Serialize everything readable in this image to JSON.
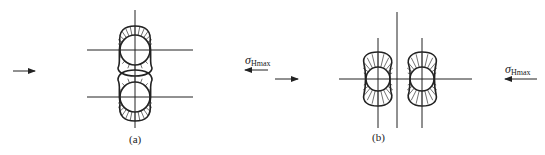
{
  "figure": {
    "panels": [
      {
        "id": "a",
        "caption": "(a)",
        "arrangement": "vertical",
        "stress_label_symbol": "σ",
        "stress_label_subscript": "Hmax"
      },
      {
        "id": "b",
        "caption": "(b)",
        "arrangement": "horizontal",
        "stress_label_symbol": "σ",
        "stress_label_subscript": "Hmax"
      }
    ]
  }
}
